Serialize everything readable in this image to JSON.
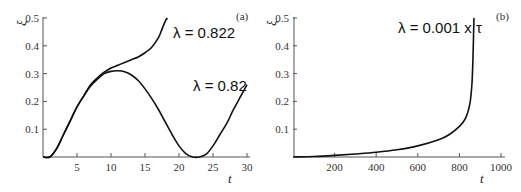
{
  "chart_data": [
    {
      "type": "line",
      "panel_label": "(a)",
      "xlabel": "t",
      "ylabel": "ξ",
      "xlim": [
        0,
        30
      ],
      "ylim": [
        0,
        0.5
      ],
      "xticks": [
        "5",
        "10",
        "15",
        "20",
        "25",
        "30"
      ],
      "yticks": [
        "0.1",
        "0.2",
        "0.3",
        "0.4",
        "0.5"
      ],
      "series": [
        {
          "name": "λ = 0.822",
          "x": [
            0,
            1,
            2,
            3,
            4,
            5,
            6,
            7,
            8,
            9,
            10,
            11,
            12,
            13,
            14,
            15,
            16,
            17,
            17.5,
            18,
            18.3
          ],
          "values": [
            0,
            0.0,
            0.03,
            0.08,
            0.13,
            0.18,
            0.22,
            0.26,
            0.285,
            0.305,
            0.32,
            0.33,
            0.34,
            0.35,
            0.36,
            0.375,
            0.395,
            0.43,
            0.46,
            0.49,
            0.5
          ]
        },
        {
          "name": "λ = 0.82",
          "x": [
            0,
            1,
            2,
            3,
            4,
            5,
            6,
            7,
            8,
            9,
            10,
            11,
            12,
            13,
            14,
            15,
            16,
            17,
            18,
            19,
            20,
            21,
            22,
            23,
            24,
            25,
            26,
            27,
            28,
            29,
            30
          ],
          "values": [
            0,
            0.0,
            0.03,
            0.08,
            0.13,
            0.18,
            0.22,
            0.255,
            0.28,
            0.3,
            0.308,
            0.31,
            0.307,
            0.295,
            0.275,
            0.245,
            0.21,
            0.17,
            0.125,
            0.08,
            0.04,
            0.012,
            0.0,
            0.0,
            0.01,
            0.04,
            0.08,
            0.12,
            0.17,
            0.215,
            0.26
          ]
        }
      ],
      "annotations": [
        "λ = 0.822",
        "λ = 0.82"
      ]
    },
    {
      "type": "line",
      "panel_label": "(b)",
      "xlabel": "t",
      "ylabel": "ξ",
      "xlim": [
        0,
        1000
      ],
      "ylim": [
        0,
        0.5
      ],
      "xticks": [
        "200",
        "400",
        "600",
        "800",
        "1000"
      ],
      "yticks": [
        "0.1",
        "0.2",
        "0.3",
        "0.4",
        "0.5"
      ],
      "series": [
        {
          "name": "λ = 0.001 x τ",
          "x": [
            0,
            100,
            200,
            300,
            400,
            500,
            600,
            700,
            750,
            800,
            830,
            850,
            860,
            865,
            870
          ],
          "values": [
            0,
            0.002,
            0.006,
            0.011,
            0.017,
            0.026,
            0.04,
            0.062,
            0.08,
            0.11,
            0.14,
            0.19,
            0.26,
            0.35,
            0.5
          ]
        }
      ],
      "annotations": [
        "λ = 0.001 x τ"
      ]
    }
  ],
  "panel_a": {
    "label": "(a)",
    "xlabel": "t",
    "ylabel": "ξ",
    "ann1": "λ = 0.822",
    "ann2": "λ = 0.82",
    "xticks": [
      "5",
      "10",
      "15",
      "20",
      "25",
      "30"
    ],
    "yticks": [
      "0.1",
      "0.2",
      "0.3",
      "0.4",
      "0.5"
    ]
  },
  "panel_b": {
    "label": "(b)",
    "xlabel": "t",
    "ylabel": "ξ",
    "ann1": "λ = 0.001 x τ",
    "xticks": [
      "200",
      "400",
      "600",
      "800",
      "1000"
    ],
    "yticks": [
      "0.1",
      "0.2",
      "0.3",
      "0.4",
      "0.5"
    ]
  }
}
